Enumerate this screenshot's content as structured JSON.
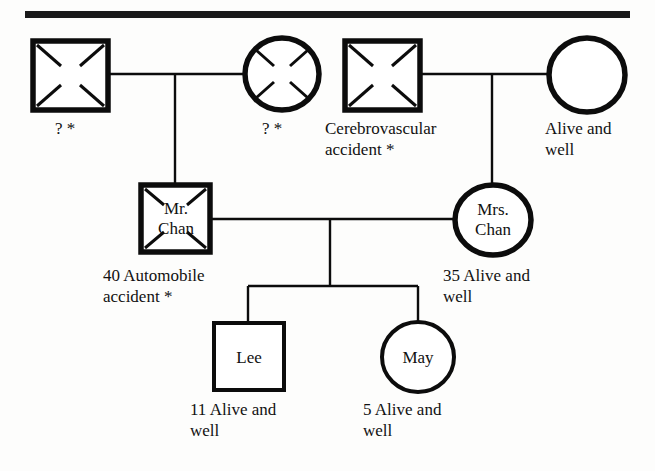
{
  "diagram": {
    "type": "genogram",
    "title_rule_color": "#1a1a1a",
    "generations": 3,
    "legend_note": "* denotes deceased"
  },
  "people": [
    {
      "id": "paternal-grandfather",
      "inner_label": "",
      "caption": "? *",
      "gender": "male",
      "shape": "square",
      "status": "deceased",
      "generation": 1
    },
    {
      "id": "paternal-grandmother",
      "inner_label": "",
      "caption": "? *",
      "gender": "female",
      "shape": "circle",
      "status": "deceased",
      "generation": 1
    },
    {
      "id": "maternal-grandfather",
      "inner_label": "",
      "caption": "Cerebrovascular\naccident *",
      "gender": "male",
      "shape": "square",
      "status": "deceased",
      "generation": 1
    },
    {
      "id": "maternal-grandmother",
      "inner_label": "",
      "caption": "Alive and\nwell",
      "gender": "female",
      "shape": "circle",
      "status": "alive",
      "generation": 1
    },
    {
      "id": "father",
      "inner_label": "Mr.\nChan",
      "caption": "40 Automobile\naccident *",
      "gender": "male",
      "shape": "square",
      "status": "deceased",
      "age": "40",
      "generation": 2
    },
    {
      "id": "mother",
      "inner_label": "Mrs.\nChan",
      "caption": "35 Alive and\nwell",
      "gender": "female",
      "shape": "circle",
      "status": "alive",
      "age": "35",
      "generation": 2
    },
    {
      "id": "son",
      "inner_label": "Lee",
      "caption": "11 Alive and\nwell",
      "gender": "male",
      "shape": "square",
      "status": "alive",
      "age": "11",
      "generation": 3
    },
    {
      "id": "daughter",
      "inner_label": "May",
      "caption": "5 Alive and\nwell",
      "gender": "female",
      "shape": "circle",
      "status": "alive",
      "age": "5",
      "generation": 3
    }
  ],
  "labels": {
    "paternal_grandfather_caption": "? *",
    "paternal_grandmother_caption": "? *",
    "maternal_grandfather_caption": "Cerebrovascular\naccident *",
    "maternal_grandmother_caption": "Alive and\nwell",
    "father_name_line1": "Mr.",
    "father_name_line2": "Chan",
    "father_caption": "40 Automobile\naccident *",
    "mother_name_line1": "Mrs.",
    "mother_name_line2": "Chan",
    "mother_caption": "35 Alive and\nwell",
    "son_name": "Lee",
    "son_caption": "11 Alive and\nwell",
    "daughter_name": "May",
    "daughter_caption": "5 Alive and\nwell"
  }
}
